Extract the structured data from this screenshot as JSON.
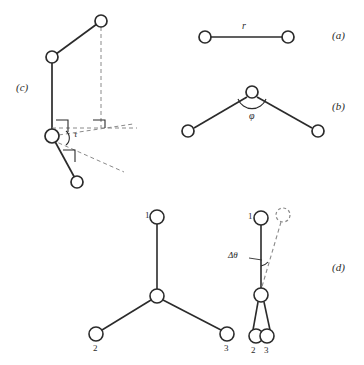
{
  "figure": {
    "cropped_header_text": "",
    "background_color": "#ffffff",
    "stroke_color": "#2b2b2b",
    "atom_fill": "#ffffff",
    "dashed_color": "#8a8a8a"
  },
  "panels": [
    {
      "key": "a",
      "label": "(a)",
      "caption_symbol": "r",
      "description": "bond length between two atoms"
    },
    {
      "key": "b",
      "label": "(b)",
      "caption_symbol": "φ",
      "description": "bond angle at central atom"
    },
    {
      "key": "c",
      "label": "(c)",
      "caption_symbol": "τ",
      "description": "torsion angle across a bond"
    },
    {
      "key": "d",
      "label": "(d)",
      "caption_symbol": "Δθ",
      "description": "out-of-plane bend of a tripod unit"
    }
  ],
  "panel_a": {
    "label": "(a)",
    "bond_label": "r",
    "atoms": [
      {
        "id": "a1",
        "cx": 205,
        "cy": 37,
        "r": 6
      },
      {
        "id": "a2",
        "cx": 288,
        "cy": 37,
        "r": 6
      }
    ]
  },
  "panel_b": {
    "label": "(b)",
    "angle_label": "φ",
    "atoms": [
      {
        "id": "b-apex",
        "cx": 252,
        "cy": 92,
        "r": 6
      },
      {
        "id": "b-left",
        "cx": 188,
        "cy": 131,
        "r": 6
      },
      {
        "id": "b-right",
        "cx": 318,
        "cy": 131,
        "r": 6
      }
    ]
  },
  "panel_c": {
    "label": "(c)",
    "torsion_label": "τ",
    "atoms": [
      {
        "id": "c-top",
        "cx": 101,
        "cy": 21,
        "r": 6
      },
      {
        "id": "c-upper",
        "cx": 52,
        "cy": 57,
        "r": 6
      },
      {
        "id": "c-pivot",
        "cx": 52,
        "cy": 136,
        "r": 7
      },
      {
        "id": "c-bottom",
        "cx": 77,
        "cy": 182,
        "r": 6
      }
    ],
    "right_angle_markers": 3
  },
  "panel_d": {
    "label": "(d)",
    "bend_label": "Δθ",
    "left_structure": {
      "atoms": [
        {
          "id": "d-l-center",
          "cx": 157,
          "cy": 296,
          "r": 7
        },
        {
          "id": "d-l-1",
          "cx": 157,
          "cy": 217,
          "r": 7,
          "number": "1"
        },
        {
          "id": "d-l-2",
          "cx": 96,
          "cy": 334,
          "r": 7,
          "number": "2"
        },
        {
          "id": "d-l-3",
          "cx": 227,
          "cy": 334,
          "r": 7,
          "number": "3"
        }
      ],
      "numbers": [
        "1",
        "2",
        "3"
      ]
    },
    "right_structure": {
      "atoms": [
        {
          "id": "d-r-center",
          "cx": 261,
          "cy": 295,
          "r": 7
        },
        {
          "id": "d-r-1",
          "cx": 261,
          "cy": 218,
          "r": 7,
          "number": "1"
        },
        {
          "id": "d-r-2",
          "cx": 256,
          "cy": 336,
          "r": 7,
          "number": "2"
        },
        {
          "id": "d-r-3",
          "cx": 267,
          "cy": 336,
          "r": 7,
          "number": "3"
        }
      ],
      "ghost_atom": {
        "id": "d-r-1-displaced",
        "cx": 283,
        "cy": 215,
        "r": 7,
        "style": "dashed"
      },
      "numbers": [
        "1",
        "2",
        "3"
      ]
    }
  }
}
